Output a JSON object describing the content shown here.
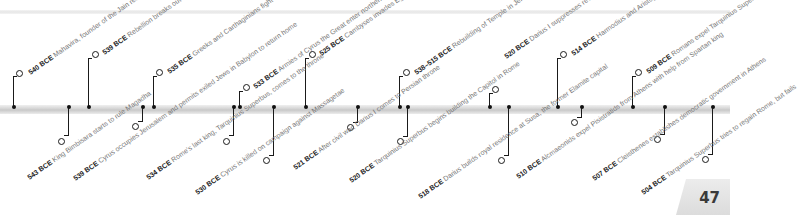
{
  "page": {
    "number": "47"
  },
  "timeline": {
    "above": [
      {
        "year": "540 BCE",
        "text": "Mahavira, founder of the Jain religion, is born"
      },
      {
        "year": "539 BCE",
        "text": "Rebellion breaks out in Babylon. Cyrus enters city and annexes it"
      },
      {
        "year": "535 BCE",
        "text": "Greeks and Carthaginians fight a naval battle off Alalia, Corsica"
      },
      {
        "year": "533 BCE",
        "text": "Armies of Cyrus the Great enter northern India"
      },
      {
        "year": "525 BCE",
        "text": "Cambyses invades Egypt, defeats Egyptians at Pelusium, captures Memphis, and deposes Pharaoh Psammetichus III, ending Saite dynasty"
      },
      {
        "year": "538–515 BCE",
        "text": "Rebuilding of Temple in Jerusalem (burnt in 587 BCE) is completed"
      },
      {
        "year": "520 BCE",
        "text": "Darius I suppresses revolt in Babylon, completes canal connecting Nile with Red Sea"
      },
      {
        "year": "514 BCE",
        "text": "Harmodius and Aristogiton revolt against Pisistratids in Athens, but fail"
      },
      {
        "year": "509 BCE",
        "text": "Romans expel Tarquinius Superbus and set up a republic"
      }
    ],
    "below": [
      {
        "year": "543 BCE",
        "text": "King Bimbisara starts to rule Magadha"
      },
      {
        "year": "539 BCE",
        "text": "Cyrus occupies Jerusalem and permits exiled Jews in Babylon to return home"
      },
      {
        "year": "534 BCE",
        "text": "Rome's last king, Tarquinius Superbus, comes to the throne"
      },
      {
        "year": "530 BCE",
        "text": "Cyrus is killed on campaign against Massagetae"
      },
      {
        "year": "521 BCE",
        "text": "After civil war, Darius I comes to Persian throne"
      },
      {
        "year": "520 BCE",
        "text": "Tarquinius Superbus begins building the Capitol in Rome"
      },
      {
        "year": "518 BCE",
        "text": "Darius builds royal residence at Susa, the former Elamite capital"
      },
      {
        "year": "510 BCE",
        "text": "Alcmaeonids expel Pisistratids from Athens with help from Spartan king"
      },
      {
        "year": "507 BCE",
        "text": "Cleisthenes establishes democratic government in Athens"
      },
      {
        "year": "504 BCE",
        "text": "Tarquinius Superbus tries to regain Rome, but fails"
      }
    ]
  }
}
